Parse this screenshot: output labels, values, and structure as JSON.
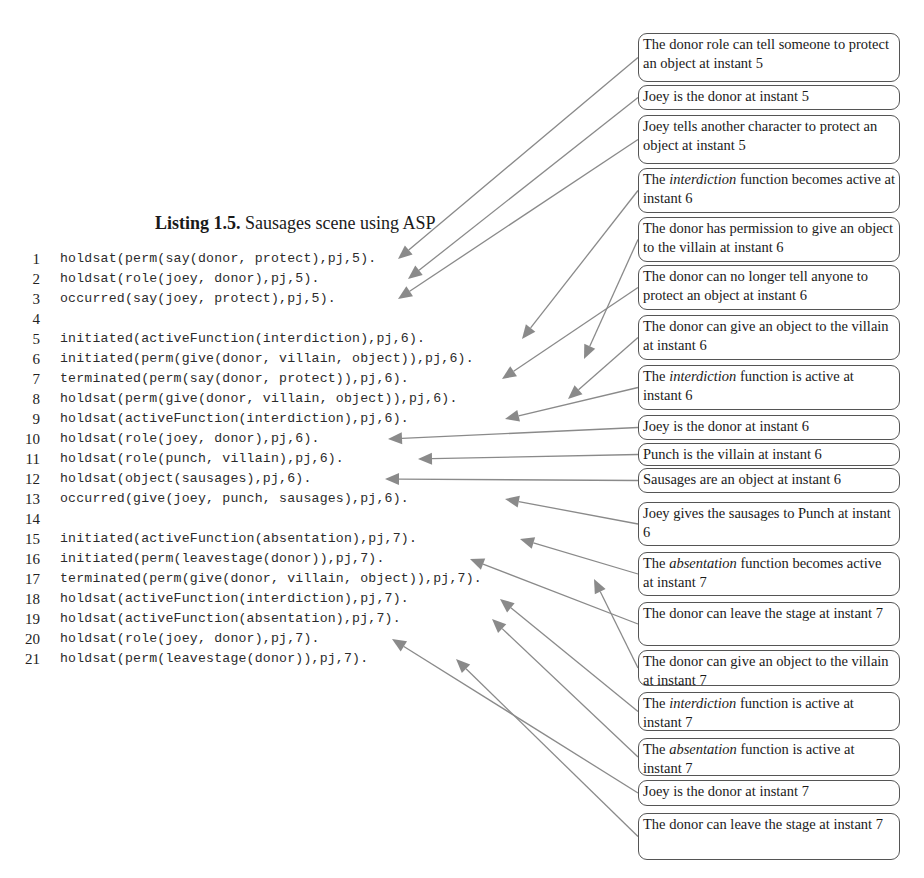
{
  "listing": {
    "label": "Listing 1.5.",
    "caption": "Sausages scene using ASP"
  },
  "code_lines": [
    {
      "n": "1",
      "text": "holdsat(perm(say(donor, protect),pj,5)."
    },
    {
      "n": "2",
      "text": "holdsat(role(joey, donor),pj,5)."
    },
    {
      "n": "3",
      "text": "occurred(say(joey, protect),pj,5)."
    },
    {
      "n": "4",
      "text": ""
    },
    {
      "n": "5",
      "text": "initiated(activeFunction(interdiction),pj,6)."
    },
    {
      "n": "6",
      "text": "initiated(perm(give(donor, villain, object)),pj,6)."
    },
    {
      "n": "7",
      "text": "terminated(perm(say(donor, protect)),pj,6)."
    },
    {
      "n": "8",
      "text": "holdsat(perm(give(donor, villain, object)),pj,6)."
    },
    {
      "n": "9",
      "text": "holdsat(activeFunction(interdiction),pj,6)."
    },
    {
      "n": "10",
      "text": "holdsat(role(joey, donor),pj,6)."
    },
    {
      "n": "11",
      "text": "holdsat(role(punch, villain),pj,6)."
    },
    {
      "n": "12",
      "text": "holdsat(object(sausages),pj,6)."
    },
    {
      "n": "13",
      "text": "occurred(give(joey, punch, sausages),pj,6)."
    },
    {
      "n": "14",
      "text": ""
    },
    {
      "n": "15",
      "text": "initiated(activeFunction(absentation),pj,7)."
    },
    {
      "n": "16",
      "text": "initiated(perm(leavestage(donor)),pj,7)."
    },
    {
      "n": "17",
      "text": "terminated(perm(give(donor, villain, object)),pj,7)."
    },
    {
      "n": "18",
      "text": "holdsat(activeFunction(interdiction),pj,7)."
    },
    {
      "n": "19",
      "text": "holdsat(activeFunction(absentation),pj,7)."
    },
    {
      "n": "20",
      "text": "holdsat(role(joey, donor),pj,7)."
    },
    {
      "n": "21",
      "text": "holdsat(perm(leavestage(donor)),pj,7)."
    }
  ],
  "annotations": [
    {
      "pre": "The donor role can tell someone to protect an object at instant 5",
      "em": "",
      "post": "",
      "top": 33,
      "height": 49,
      "target_line": 1,
      "target_x": 398
    },
    {
      "pre": "Joey is the donor at instant 5",
      "em": "",
      "post": "",
      "top": 85,
      "height": 25,
      "target_line": 2,
      "target_x": 408
    },
    {
      "pre": "Joey tells another character to protect an object at instant 5",
      "em": "",
      "post": "",
      "top": 115,
      "height": 49,
      "target_line": 3,
      "target_x": 398
    },
    {
      "pre": "The ",
      "em": "interdiction",
      "post": " function becomes active at instant 6",
      "top": 168,
      "height": 45,
      "target_line": 5,
      "target_x": 522
    },
    {
      "pre": "The donor has permission to give an object to the villain at instant 6",
      "em": "",
      "post": "",
      "top": 217,
      "height": 45,
      "target_line": 6,
      "target_x": 584
    },
    {
      "pre": "The donor can no longer tell anyone to protect an object at instant 6",
      "em": "",
      "post": "",
      "top": 265,
      "height": 45,
      "target_line": 7,
      "target_x": 502
    },
    {
      "pre": "The donor can give an object to the villain at instant 6",
      "em": "",
      "post": "",
      "top": 315,
      "height": 45,
      "target_line": 8,
      "target_x": 568
    },
    {
      "pre": "The ",
      "em": "interdiction",
      "post": " function is active at instant 6",
      "top": 365,
      "height": 45,
      "target_line": 9,
      "target_x": 505
    },
    {
      "pre": "Joey is the donor at instant 6",
      "em": "",
      "post": "",
      "top": 415,
      "height": 25,
      "target_line": 10,
      "target_x": 388
    },
    {
      "pre": "Punch is the villain at instant 6",
      "em": "",
      "post": "",
      "top": 443,
      "height": 23,
      "target_line": 11,
      "target_x": 418
    },
    {
      "pre": "Sausages are an object at instant 6",
      "em": "",
      "post": "",
      "top": 468,
      "height": 25,
      "target_line": 12,
      "target_x": 385
    },
    {
      "pre": "Joey gives the sausages to Punch at instant 6",
      "em": "",
      "post": "",
      "top": 502,
      "height": 44,
      "target_line": 13,
      "target_x": 505
    },
    {
      "pre": "The ",
      "em": "absentation",
      "post": " function becomes active at instant 7",
      "top": 552,
      "height": 44,
      "target_line": 15,
      "target_x": 520
    },
    {
      "pre": "The donor can leave the stage at instant 7",
      "em": "",
      "post": "",
      "top": 602,
      "height": 44,
      "target_line": 16,
      "target_x": 470
    },
    {
      "pre": "The donor can give an object to the villain at instant 7",
      "em": "",
      "post": "",
      "top": 650,
      "height": 36,
      "target_line": 17,
      "target_x": 594
    },
    {
      "pre": "The ",
      "em": "interdiction",
      "post": " function is active at instant 7",
      "top": 692,
      "height": 39,
      "target_line": 18,
      "target_x": 500
    },
    {
      "pre": "The ",
      "em": "absentation",
      "post": " function is active at instant 7",
      "top": 738,
      "height": 38,
      "target_line": 19,
      "target_x": 492
    },
    {
      "pre": "Joey is the donor at instant 7",
      "em": "",
      "post": "",
      "top": 780,
      "height": 26,
      "target_line": 20,
      "target_x": 392
    },
    {
      "pre": "The donor can leave the stage at instant 7",
      "em": "",
      "post": "",
      "top": 813,
      "height": 47,
      "target_line": 21,
      "target_x": 456
    }
  ],
  "colors": {
    "arrow": "#8a8a8a",
    "box_border": "#555555",
    "text": "#1a1a1a"
  }
}
